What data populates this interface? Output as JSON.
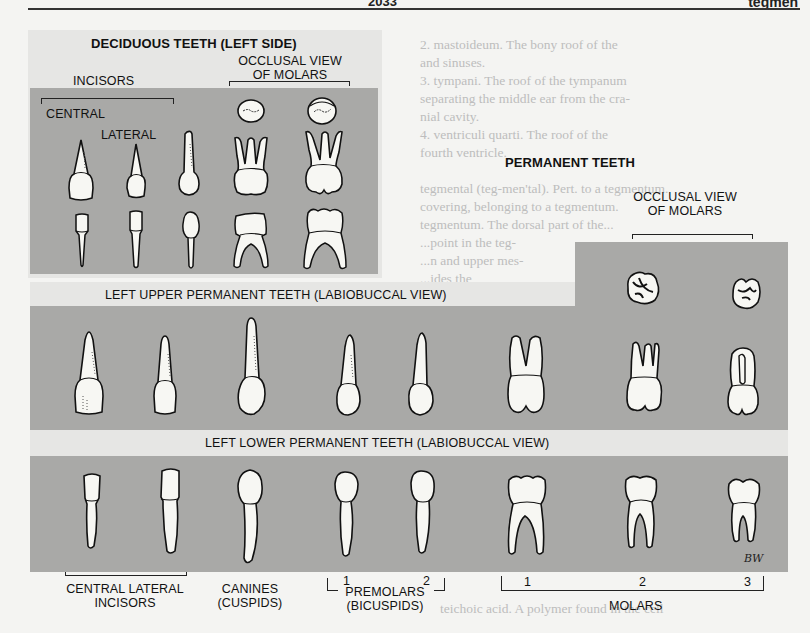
{
  "page_header": {
    "center_text": "2033",
    "right_text": "tegmen"
  },
  "background_text": [
    "2. mastoideum. The bony roof of the",
    "   mastoid antrum",
    "   and sinuses.",
    "3. tympani. The roof of the tympanum",
    "   separating the middle ear from the cra-",
    "   nial cavity.",
    "4. ventriculi quarti. The roof of the",
    "   fourth ventricle.",
    "tegmental (teg-men'tal). Pert. to a tegmentum.",
    "   covering, belonging to a tegmentum.",
    "tegmentum. The dorsal part of the...",
    "   ...point in the teg-",
    "   ...n and upper mes-",
    "   ...ides the",
    "...the ventral nuclei of the mesen-",
    "...the nuclei and bundle-axons of the pons.",
    "...ogenic...",
    "teichoic acid. A polymer found in the cell",
    "...teichoic acid ..."
  ],
  "deciduous": {
    "title": "DECIDUOUS TEETH (LEFT SIDE)",
    "incisors_label": "INCISORS",
    "central_label": "CENTRAL",
    "lateral_label": "LATERAL",
    "occlusal_label_line1": "OCCLUSAL VIEW",
    "occlusal_label_line2": "OF MOLARS"
  },
  "permanent": {
    "title": "PERMANENT TEETH",
    "occlusal_label_line1": "OCCLUSAL VIEW",
    "occlusal_label_line2": "OF MOLARS",
    "upper_title": "LEFT UPPER PERMANENT TEETH (LABIOBUCCAL VIEW)",
    "lower_title": "LEFT LOWER PERMANENT TEETH (LABIOBUCCAL VIEW)"
  },
  "bottom_labels": {
    "incisors_line1": "CENTRAL LATERAL",
    "incisors_line2": "INCISORS",
    "canines_line1": "CANINES",
    "canines_line2": "(CUSPIDS)",
    "premolar_1": "1",
    "premolar_2": "2",
    "premolars_line1": "PREMOLARS",
    "premolars_line2": "(BICUSPIDS)",
    "molar_1": "1",
    "molar_2": "2",
    "molar_3": "3",
    "molars_label": "MOLARS"
  },
  "artist_signature": "BW",
  "colors": {
    "panel": "#a9a9a7",
    "halo": "#e6e6e4",
    "page": "#f4f4f2",
    "tooth_fill": "#f7f7f3",
    "outline": "#111111"
  }
}
